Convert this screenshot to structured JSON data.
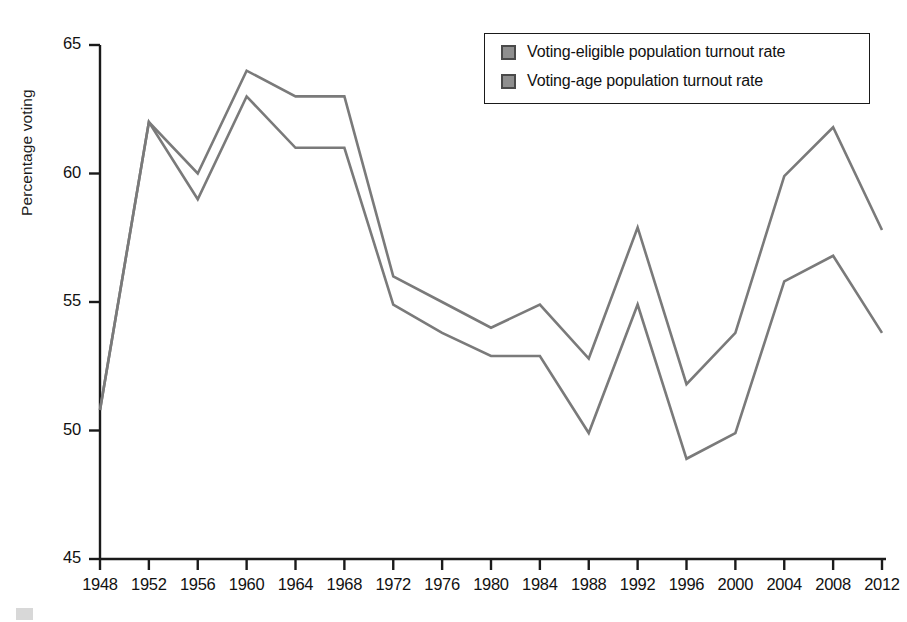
{
  "chart_data": {
    "type": "line",
    "title": "",
    "subtitle": "",
    "xlabel": "",
    "ylabel": "Percentage voting",
    "categories": [
      1948,
      1952,
      1956,
      1960,
      1964,
      1968,
      1972,
      1976,
      1980,
      1984,
      1988,
      1992,
      1996,
      2000,
      2004,
      2008,
      2012
    ],
    "xlim": [
      1948,
      2012
    ],
    "ylim": [
      45,
      65
    ],
    "yticks": [
      45,
      50,
      55,
      60,
      65
    ],
    "xticks": [
      "1948",
      "1952",
      "1956",
      "1960",
      "1964",
      "1968",
      "1972",
      "1976",
      "1980",
      "1984",
      "1988",
      "1992",
      "1996",
      "2000",
      "2004",
      "2008",
      "2012"
    ],
    "ytick_labels": [
      "65",
      "60",
      "55",
      "50",
      "45"
    ],
    "grid": false,
    "legend_position": "top-right",
    "line_color": "#7a7a7a",
    "axis_color": "#1a1a1a",
    "series": [
      {
        "name": "Voting-eligible population turnout rate",
        "swatch_color": "#8f8f8f",
        "values": [
          50.8,
          62.0,
          60.0,
          64.0,
          63.0,
          63.0,
          56.0,
          55.0,
          54.0,
          54.9,
          52.8,
          57.9,
          51.8,
          53.8,
          59.9,
          61.8,
          57.8
        ]
      },
      {
        "name": "Voting-age population turnout rate",
        "swatch_color": "#8f8f8f",
        "values": [
          50.8,
          62.0,
          59.0,
          63.0,
          61.0,
          61.0,
          54.9,
          53.8,
          52.9,
          52.9,
          49.9,
          54.9,
          48.9,
          49.9,
          55.8,
          56.8,
          53.8
        ]
      }
    ]
  },
  "legend": {
    "items": [
      {
        "label": "Voting-eligible population turnout rate"
      },
      {
        "label": "Voting-age population turnout rate"
      }
    ]
  }
}
